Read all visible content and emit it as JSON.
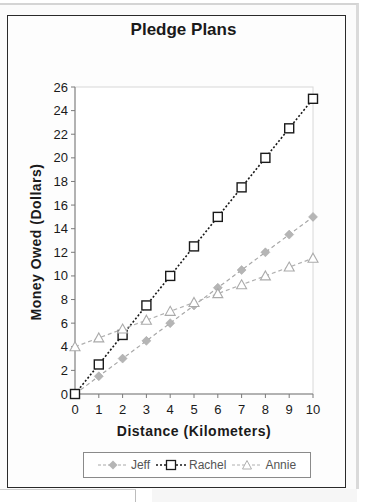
{
  "chart_data": {
    "type": "line",
    "title": "Pledge Plans",
    "xlabel": "Distance (Kilometers)",
    "ylabel": "Money Owed (Dollars)",
    "x": [
      0,
      1,
      2,
      3,
      4,
      5,
      6,
      7,
      8,
      9,
      10
    ],
    "xlim": [
      0,
      10
    ],
    "ylim": [
      0,
      26
    ],
    "x_ticks": [
      "0",
      "1",
      "2",
      "3",
      "4",
      "5",
      "6",
      "7",
      "8",
      "9",
      "10"
    ],
    "y_ticks": [
      "0",
      "2",
      "4",
      "6",
      "8",
      "10",
      "12",
      "14",
      "16",
      "18",
      "20",
      "22",
      "24",
      "26"
    ],
    "grid": false,
    "legend_position": "bottom",
    "series": [
      {
        "name": "Jeff",
        "marker": "diamond",
        "line": "dashed",
        "color": "#a8a8a8",
        "values": [
          0,
          1.5,
          3,
          4.5,
          6,
          7.5,
          9,
          10.5,
          12,
          13.5,
          15
        ]
      },
      {
        "name": "Rachel",
        "marker": "square",
        "line": "dotted",
        "color": "#1a1a1a",
        "values": [
          0,
          2.5,
          5,
          7.5,
          10,
          12.5,
          15,
          17.5,
          20,
          22.5,
          25
        ]
      },
      {
        "name": "Annie",
        "marker": "triangle",
        "line": "dashed",
        "color": "#b0b0b0",
        "values": [
          4,
          4.75,
          5.5,
          6.25,
          7,
          7.75,
          8.5,
          9.25,
          10,
          10.75,
          11.5
        ]
      }
    ]
  },
  "legend": {
    "items": [
      {
        "label": "Jeff"
      },
      {
        "label": "Rachel"
      },
      {
        "label": "Annie"
      }
    ]
  }
}
